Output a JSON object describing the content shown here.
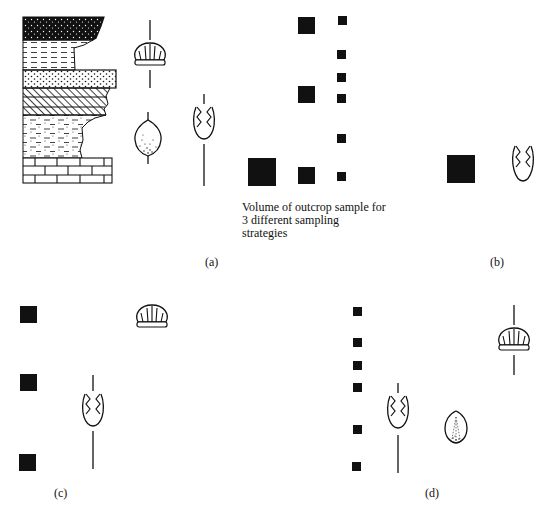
{
  "caption": {
    "line1": "Volume of outcrop sample for",
    "line2": "3 different sampling",
    "line3": "strategies"
  },
  "panels": {
    "a": {
      "label": "(a)"
    },
    "b": {
      "label": "(b)"
    },
    "c": {
      "label": "(c)"
    },
    "d": {
      "label": "(d)"
    }
  },
  "log_layers": [
    "dark speckled (conglomerate/coarse)",
    "dashed (shale)",
    "dotted (sandstone)",
    "hatched (cross-bedded)",
    "dash-dot (siltstone)",
    "brick (limestone)"
  ],
  "fossils": [
    "scallop-shell",
    "brachiopod-egg",
    "graptolite-wheat"
  ],
  "colors": {
    "ink": "#111111",
    "background": "#ffffff"
  }
}
